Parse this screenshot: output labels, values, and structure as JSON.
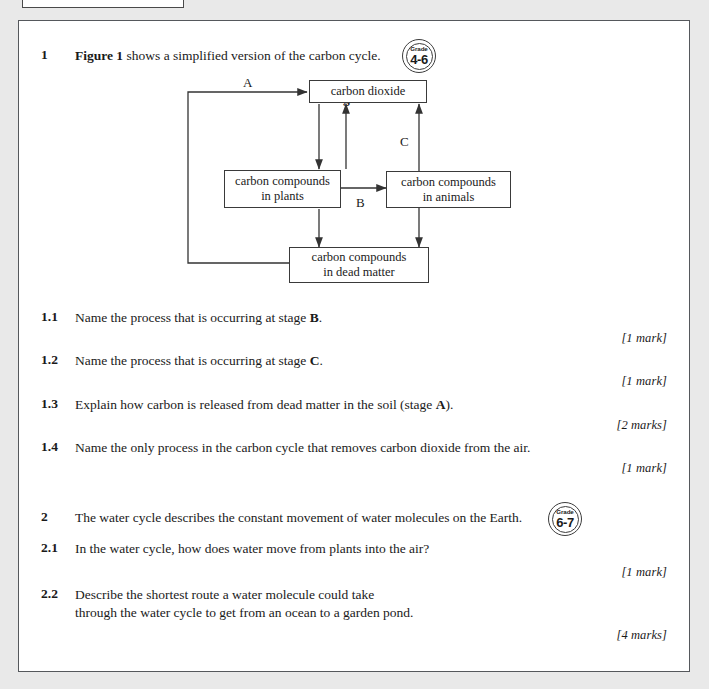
{
  "worksheet": {
    "figure": {
      "title": "Figure 1",
      "nodes": {
        "co2": "carbon dioxide",
        "plants_line1": "carbon compounds",
        "plants_line2": "in plants",
        "animals_line1": "carbon compounds",
        "animals_line2": "in animals",
        "dead_line1": "carbon compounds",
        "dead_line2": "in dead matter"
      },
      "labels": {
        "a": "A",
        "b": "B",
        "c": "C"
      }
    },
    "questions": [
      {
        "number": "1",
        "text_prefix": "Figure 1",
        "text_rest": " shows a simplified version of the carbon cycle.",
        "badge": {
          "word": "Grade",
          "range": "4-6"
        }
      },
      {
        "number": "1.1",
        "text_a": "Name the process that is occurring at stage ",
        "text_b": "B",
        "text_c": ".",
        "marks": "[1 mark]"
      },
      {
        "number": "1.2",
        "text_a": "Name the process that is occurring at stage ",
        "text_b": "C",
        "text_c": ".",
        "marks": "[1 mark]"
      },
      {
        "number": "1.3",
        "text_a": "Explain how carbon is released from dead matter in the soil (stage ",
        "text_b": "A",
        "text_c": ").",
        "marks": "[2 marks]"
      },
      {
        "number": "1.4",
        "text_a": "Name the only process in the carbon cycle that removes carbon dioxide from the air.",
        "text_b": "",
        "text_c": "",
        "marks": "[1 mark]"
      },
      {
        "number": "2",
        "text_a": "The water cycle describes the constant movement of water molecules on the Earth.",
        "badge": {
          "word": "Grade",
          "range": "6-7"
        }
      },
      {
        "number": "2.1",
        "text_a": "In the water cycle, how does water move from plants into the air?",
        "marks": "[1 mark]"
      },
      {
        "number": "2.2",
        "text_line1": "Describe the shortest route a water molecule could take",
        "text_line2": "through the water cycle to get from an ocean to a garden pond.",
        "marks": "[4 marks]"
      }
    ]
  }
}
